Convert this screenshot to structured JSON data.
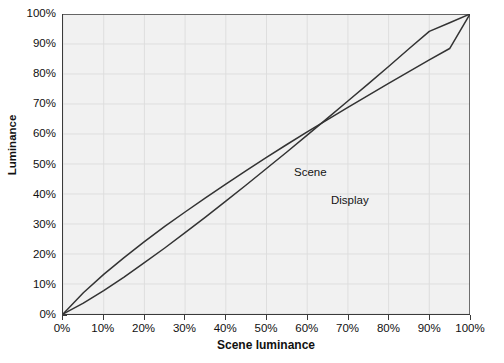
{
  "chart_data": {
    "type": "line",
    "title": "",
    "xlabel": "Scene luminance",
    "ylabel": "Luminance",
    "xlim": [
      0,
      100
    ],
    "ylim": [
      0,
      100
    ],
    "grid": true,
    "legend_position": "inline-annotation",
    "x_tick_labels": [
      "0%",
      "10%",
      "20%",
      "30%",
      "40%",
      "50%",
      "60%",
      "70%",
      "80%",
      "90%",
      "100%"
    ],
    "y_tick_labels": [
      "0%",
      "10%",
      "20%",
      "30%",
      "40%",
      "50%",
      "60%",
      "70%",
      "80%",
      "90%",
      "100%"
    ],
    "x_tick_values": [
      0,
      10,
      20,
      30,
      40,
      50,
      60,
      70,
      80,
      90,
      100
    ],
    "y_tick_values": [
      0,
      10,
      20,
      30,
      40,
      50,
      60,
      70,
      80,
      90,
      100
    ],
    "x": [
      0,
      5,
      10,
      15,
      20,
      25,
      30,
      35,
      40,
      45,
      50,
      55,
      60,
      65,
      70,
      75,
      80,
      85,
      90,
      95,
      100
    ],
    "series": [
      {
        "name": "Scene",
        "color": "#333333",
        "values": [
          0.0,
          7.1,
          13.2,
          18.8,
          24.1,
          29.2,
          34.0,
          38.7,
          43.3,
          47.8,
          52.2,
          56.5,
          60.7,
          64.8,
          68.9,
          72.9,
          76.9,
          80.8,
          84.7,
          88.5,
          100.0
        ]
      },
      {
        "name": "Display",
        "color": "#333333",
        "values": [
          0.0,
          3.6,
          7.8,
          12.3,
          17.1,
          22.0,
          27.1,
          32.3,
          37.6,
          43.0,
          48.5,
          54.0,
          59.6,
          65.3,
          71.0,
          76.7,
          82.5,
          88.4,
          94.2,
          97.1,
          100.0
        ]
      }
    ],
    "annotations": [
      {
        "text": "Scene",
        "x": 41,
        "y": 50
      },
      {
        "text": "Display",
        "x": 51,
        "y": 41
      }
    ]
  },
  "axes": {
    "y_title": "Luminance",
    "x_title": "Scene luminance",
    "y_ticks": [
      {
        "label": "100%",
        "value": 100
      },
      {
        "label": "90%",
        "value": 90
      },
      {
        "label": "80%",
        "value": 80
      },
      {
        "label": "70%",
        "value": 70
      },
      {
        "label": "60%",
        "value": 60
      },
      {
        "label": "50%",
        "value": 50
      },
      {
        "label": "40%",
        "value": 40
      },
      {
        "label": "30%",
        "value": 30
      },
      {
        "label": "20%",
        "value": 20
      },
      {
        "label": "10%",
        "value": 10
      },
      {
        "label": "0%",
        "value": 0
      }
    ],
    "x_ticks": [
      {
        "label": "0%",
        "value": 0
      },
      {
        "label": "10%",
        "value": 10
      },
      {
        "label": "20%",
        "value": 20
      },
      {
        "label": "30%",
        "value": 30
      },
      {
        "label": "40%",
        "value": 40
      },
      {
        "label": "50%",
        "value": 50
      },
      {
        "label": "60%",
        "value": 60
      },
      {
        "label": "70%",
        "value": 70
      },
      {
        "label": "80%",
        "value": 80
      },
      {
        "label": "90%",
        "value": 90
      },
      {
        "label": "100%",
        "value": 100
      }
    ]
  },
  "labels": {
    "scene_series": "Scene",
    "display_series": "Display"
  },
  "colors": {
    "plot_background": "#f1f1f1",
    "page_background": "#ffffff",
    "grid": "#dedede",
    "axis": "#3a3a3a",
    "line": "#333333",
    "text": "#111111"
  }
}
